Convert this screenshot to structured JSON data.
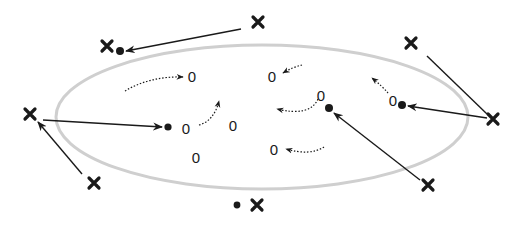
{
  "diagram": {
    "colors": {
      "ellipse_stroke": "#cfcfcf",
      "ink": "#1a1a1a",
      "background": "#ffffff"
    },
    "ellipse": {
      "cx": 262,
      "cy": 117,
      "rx": 206,
      "ry": 72
    },
    "x_markers": [
      {
        "id": "x1",
        "label": "X",
        "x": 258,
        "y": 22
      },
      {
        "id": "x2",
        "label": "X",
        "x": 107,
        "y": 46
      },
      {
        "id": "x3",
        "label": "X",
        "x": 411,
        "y": 43
      },
      {
        "id": "x4",
        "label": "X",
        "x": 493,
        "y": 119
      },
      {
        "id": "x5",
        "label": "X",
        "x": 30,
        "y": 114
      },
      {
        "id": "x6",
        "label": "X",
        "x": 94,
        "y": 183
      },
      {
        "id": "x7",
        "label": "X",
        "x": 428,
        "y": 185
      },
      {
        "id": "x8",
        "label": "X",
        "x": 257,
        "y": 205
      }
    ],
    "dots": [
      {
        "id": "d1",
        "x": 120,
        "y": 51
      },
      {
        "id": "d2",
        "x": 168,
        "y": 127
      },
      {
        "id": "d3",
        "x": 329,
        "y": 108
      },
      {
        "id": "d4",
        "x": 402,
        "y": 105
      },
      {
        "id": "d5",
        "x": 237,
        "y": 205
      }
    ],
    "zeros": [
      {
        "id": "z1",
        "label": "0",
        "x": 192,
        "y": 77
      },
      {
        "id": "z2",
        "label": "0",
        "x": 272,
        "y": 77
      },
      {
        "id": "z3",
        "label": "0",
        "x": 186,
        "y": 128
      },
      {
        "id": "z4",
        "label": "0",
        "x": 233,
        "y": 126
      },
      {
        "id": "z5",
        "label": "0",
        "x": 321,
        "y": 96
      },
      {
        "id": "z6",
        "label": "0",
        "x": 392,
        "y": 100
      },
      {
        "id": "z7",
        "label": "0",
        "x": 196,
        "y": 158
      },
      {
        "id": "z8",
        "label": "0",
        "x": 274,
        "y": 150
      }
    ],
    "solid_arrows": [
      {
        "from": "x1",
        "to": "d1"
      },
      {
        "from": "x5",
        "to": "d2"
      },
      {
        "from": "x6",
        "to": "x5"
      },
      {
        "from": "x4",
        "to": "d4"
      },
      {
        "from": "x4",
        "to": "x3",
        "head": false
      },
      {
        "from": "x7",
        "to": "d3"
      }
    ],
    "dotted_arrows": 6
  }
}
